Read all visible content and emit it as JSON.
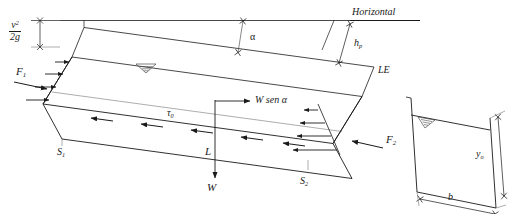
{
  "figure": {
    "stroke_color": "#1a1a1a",
    "thin_color": "#555555",
    "background": "#ffffff"
  },
  "labels": {
    "velocity_head_numerator": "v",
    "velocity_head_num_exp": "2",
    "velocity_head_denominator": "2g",
    "horizontal": "Horizontal",
    "alpha": "α",
    "head_loss": "h",
    "head_loss_sub": "p",
    "energy_line": "LE",
    "force_1": "F",
    "force_1_sub": "1",
    "force_2": "F",
    "force_2_sub": "2",
    "shear_stress": "τ",
    "shear_stress_sub": "0",
    "weight_component": "W sen α",
    "length": "L",
    "weight": "W",
    "section_1": "S",
    "section_1_sub": "1",
    "section_2": "S",
    "section_2_sub": "2",
    "depth": "y",
    "depth_sub": "o",
    "width": "b"
  }
}
